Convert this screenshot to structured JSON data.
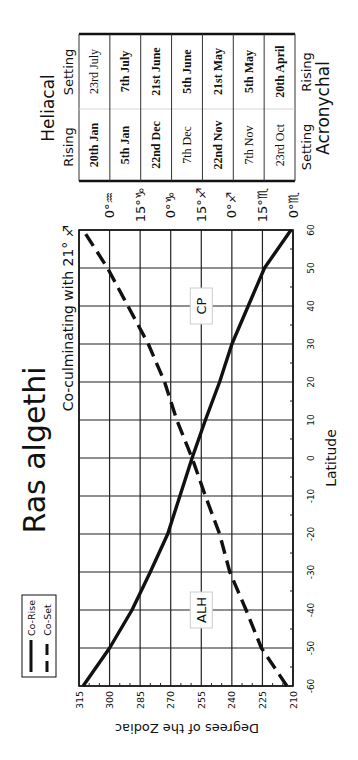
{
  "chart_data": {
    "type": "line",
    "orientation": "rotated-90-ccw",
    "title": "Ras algethi",
    "subtitle": "Co-culminating with 21° ♐",
    "xlabel": "Latitude",
    "ylabel": "Degrees of the Zodiac",
    "xlim": [
      -60,
      60
    ],
    "ylim": [
      210,
      315
    ],
    "x_ticks": [
      -60,
      -50,
      -40,
      -30,
      -20,
      -10,
      0,
      10,
      20,
      30,
      40,
      50,
      60
    ],
    "y_ticks": [
      315,
      300,
      285,
      270,
      255,
      240,
      225,
      210
    ],
    "y_tick_labels": [
      "315",
      "300",
      "285",
      "270",
      "255",
      "240",
      "225",
      "210"
    ],
    "zodiac_labels": [
      {
        "deg": 300,
        "label": "0°♒"
      },
      {
        "deg": 285,
        "label": "15°♑"
      },
      {
        "deg": 270,
        "label": "0°♑"
      },
      {
        "deg": 255,
        "label": "15°♐"
      },
      {
        "deg": 240,
        "label": "0°♐"
      },
      {
        "deg": 225,
        "label": "15°♏"
      },
      {
        "deg": 210,
        "label": "0°♏"
      }
    ],
    "grid": true,
    "legend": {
      "position": "upper-left",
      "entries": [
        "Co-Rise",
        "Co-Set"
      ]
    },
    "x": [
      -60,
      -50,
      -40,
      -30,
      -20,
      -10,
      0,
      10,
      20,
      30,
      40,
      50,
      60
    ],
    "series": [
      {
        "name": "Co-Rise",
        "style": "solid",
        "values": [
          313,
          300,
          289,
          280,
          271.5,
          265.5,
          259.5,
          253,
          246,
          240,
          232,
          224,
          211
        ]
      },
      {
        "name": "Co-Set",
        "style": "dashed",
        "values": [
          213,
          225.5,
          233,
          241,
          246,
          253,
          259.5,
          267,
          273,
          281,
          291,
          301,
          313
        ]
      }
    ],
    "annotations": [
      {
        "text": "ALH",
        "x": -40,
        "y": 255
      },
      {
        "text": "CP",
        "x": 40,
        "y": 255
      }
    ]
  },
  "table": {
    "top_group": "Heliacal",
    "top_col_left": "Setting",
    "top_col_right": "Rising",
    "bottom_group": "Acronychal",
    "bottom_col_left": "Rising",
    "bottom_col_right": "Setting",
    "rows": [
      {
        "setting": "23rd July",
        "rising": "20th Jan",
        "setting_bold": false,
        "rising_bold": true
      },
      {
        "setting": "7th July",
        "rising": "5th Jan",
        "setting_bold": true,
        "rising_bold": true
      },
      {
        "setting": "21st June",
        "rising": "22nd Dec",
        "setting_bold": true,
        "rising_bold": true
      },
      {
        "setting": "5th June",
        "rising": "7th Dec",
        "setting_bold": true,
        "rising_bold": false
      },
      {
        "setting": "21st May",
        "rising": "22nd Nov",
        "setting_bold": true,
        "rising_bold": true
      },
      {
        "setting": "5th May",
        "rising": "7th Nov",
        "setting_bold": true,
        "rising_bold": false
      },
      {
        "setting": "20th April",
        "rising": "23rd Oct",
        "setting_bold": true,
        "rising_bold": false
      }
    ]
  }
}
